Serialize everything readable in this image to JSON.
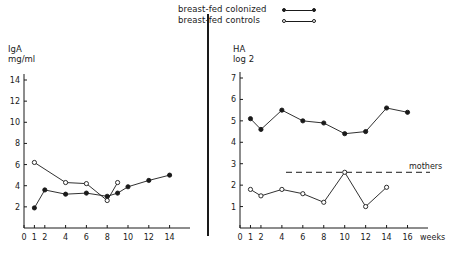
{
  "legend": {
    "items": [
      {
        "label": "breast-fed colonized",
        "marker": "filled-circle-line"
      },
      {
        "label": "breast-fed controls",
        "marker": "open-circle-line"
      }
    ]
  },
  "chart_data": [
    {
      "type": "line",
      "panel": "left",
      "title": "",
      "ylabel": "IgA\nmg/ml",
      "xlabel": "",
      "xlim": [
        0,
        15
      ],
      "ylim": [
        0,
        14
      ],
      "xticks": [
        0,
        1,
        2,
        4,
        6,
        8,
        10,
        12,
        14
      ],
      "yticks": [
        2,
        4,
        6,
        8,
        10,
        12,
        14
      ],
      "grid": false,
      "legend_position": "above-center",
      "series": [
        {
          "name": "breast-fed colonized",
          "marker": "filled",
          "x": [
            1,
            2,
            4,
            6,
            8,
            9,
            10,
            12,
            14
          ],
          "y": [
            1.9,
            3.6,
            3.2,
            3.3,
            3.0,
            3.3,
            3.9,
            4.5,
            5.0
          ]
        },
        {
          "name": "breast-fed controls",
          "marker": "open",
          "x": [
            1,
            4,
            6,
            8,
            9
          ],
          "y": [
            6.2,
            4.3,
            4.2,
            2.6,
            4.3
          ]
        }
      ]
    },
    {
      "type": "line",
      "panel": "right",
      "title": "",
      "ylabel": "HA\nlog 2",
      "xlabel": "weeks",
      "xlim": [
        0,
        17
      ],
      "ylim": [
        0,
        7
      ],
      "xticks": [
        0,
        1,
        2,
        4,
        6,
        8,
        10,
        12,
        14,
        16
      ],
      "yticks": [
        1,
        2,
        3,
        4,
        5,
        6,
        7
      ],
      "grid": false,
      "annotations": [
        {
          "type": "hline",
          "label": "mothers",
          "y": 2.6,
          "style": "dashed"
        }
      ],
      "series": [
        {
          "name": "breast-fed colonized",
          "marker": "filled",
          "x": [
            1,
            2,
            4,
            6,
            8,
            10,
            12,
            14,
            16
          ],
          "y": [
            5.1,
            4.6,
            5.5,
            5.0,
            4.9,
            4.4,
            4.5,
            5.6,
            5.4
          ]
        },
        {
          "name": "breast-fed controls",
          "marker": "open",
          "x": [
            1,
            2,
            4,
            6,
            8,
            10,
            12,
            14
          ],
          "y": [
            1.8,
            1.5,
            1.8,
            1.6,
            1.2,
            2.6,
            1.0,
            1.9
          ]
        }
      ]
    }
  ],
  "labels": {
    "left_axis_title": "IgA\nmg/ml",
    "right_axis_title": "HA\nlog 2",
    "weeks": "weeks",
    "mothers": "mothers"
  }
}
